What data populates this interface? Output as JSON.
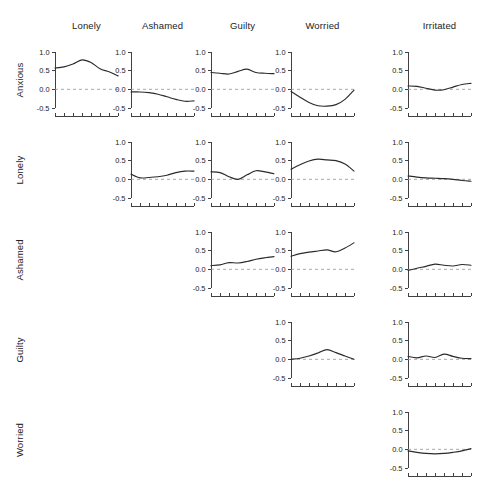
{
  "figure": {
    "width": 492,
    "height": 498,
    "background": "#ffffff",
    "line_color": "#2b2b2b",
    "zero_line_color": "#9a9a9a",
    "axis_color": "#2b2b2b"
  },
  "column_headers": [
    {
      "label": "Lonely"
    },
    {
      "label": "Ashamed"
    },
    {
      "label": "Guilty"
    },
    {
      "label": "Worried"
    },
    {
      "label": "Irritated"
    }
  ],
  "row_labels": [
    {
      "label": "Anxious"
    },
    {
      "label": "Lonely"
    },
    {
      "label": "Ashamed"
    },
    {
      "label": "Guilty"
    },
    {
      "label": "Worried"
    }
  ],
  "axis": {
    "y_ticks": [
      "1.0",
      "0.5",
      "0.0",
      "-0.5"
    ],
    "y_tick_values": [
      1.0,
      0.5,
      0.0,
      -0.5
    ],
    "ylim": [
      -0.5,
      1.0
    ],
    "x_tick_count": 8,
    "zero_reference": 0.0,
    "grid": false
  },
  "chart_data": {
    "type": "line",
    "title": "",
    "subtitle": "",
    "xlabel": "",
    "ylabel": "",
    "ylim": [
      -0.5,
      1.0
    ],
    "xlim": [
      0,
      1
    ],
    "grid": false,
    "legend": "none",
    "layout": "upper-triangular matrix of small-multiple line panels",
    "rows": [
      "Anxious",
      "Lonely",
      "Ashamed",
      "Guilty",
      "Worried"
    ],
    "columns": [
      "Lonely",
      "Ashamed",
      "Guilty",
      "Worried",
      "Irritated"
    ],
    "x": [
      0,
      0.1428,
      0.2857,
      0.4285,
      0.5714,
      0.7142,
      0.8571,
      1
    ],
    "panels": [
      {
        "row": "Anxious",
        "column": "Lonely",
        "row_index": 0,
        "col_index": 0,
        "values": [
          0.57,
          0.6,
          0.68,
          0.79,
          0.72,
          0.55,
          0.47,
          0.36
        ]
      },
      {
        "row": "Anxious",
        "column": "Ashamed",
        "row_index": 0,
        "col_index": 1,
        "values": [
          -0.07,
          -0.07,
          -0.09,
          -0.13,
          -0.2,
          -0.27,
          -0.32,
          -0.31
        ]
      },
      {
        "row": "Anxious",
        "column": "Guilty",
        "row_index": 0,
        "col_index": 2,
        "values": [
          0.45,
          0.43,
          0.41,
          0.48,
          0.54,
          0.45,
          0.43,
          0.42
        ]
      },
      {
        "row": "Anxious",
        "column": "Worried",
        "row_index": 0,
        "col_index": 3,
        "values": [
          -0.06,
          -0.21,
          -0.35,
          -0.44,
          -0.45,
          -0.41,
          -0.27,
          -0.02
        ]
      },
      {
        "row": "Anxious",
        "column": "Irritated",
        "row_index": 0,
        "col_index": 4,
        "values": [
          0.09,
          0.08,
          0.03,
          -0.02,
          -0.01,
          0.06,
          0.13,
          0.16
        ]
      },
      {
        "row": "Lonely",
        "column": "Ashamed",
        "row_index": 1,
        "col_index": 1,
        "values": [
          0.14,
          0.04,
          0.05,
          0.07,
          0.11,
          0.18,
          0.22,
          0.22
        ]
      },
      {
        "row": "Lonely",
        "column": "Guilty",
        "row_index": 1,
        "col_index": 2,
        "values": [
          0.2,
          0.18,
          0.07,
          0.0,
          0.12,
          0.23,
          0.2,
          0.15
        ]
      },
      {
        "row": "Lonely",
        "column": "Worried",
        "row_index": 1,
        "col_index": 3,
        "values": [
          0.27,
          0.39,
          0.49,
          0.54,
          0.52,
          0.5,
          0.41,
          0.22
        ]
      },
      {
        "row": "Lonely",
        "column": "Irritated",
        "row_index": 1,
        "col_index": 4,
        "values": [
          0.09,
          0.06,
          0.04,
          0.03,
          0.02,
          0.0,
          -0.03,
          -0.05
        ]
      },
      {
        "row": "Ashamed",
        "column": "Guilty",
        "row_index": 2,
        "col_index": 2,
        "values": [
          0.1,
          0.12,
          0.18,
          0.17,
          0.21,
          0.27,
          0.31,
          0.34
        ]
      },
      {
        "row": "Ashamed",
        "column": "Worried",
        "row_index": 2,
        "col_index": 3,
        "values": [
          0.35,
          0.42,
          0.46,
          0.49,
          0.52,
          0.47,
          0.57,
          0.71
        ]
      },
      {
        "row": "Ashamed",
        "column": "Irritated",
        "row_index": 2,
        "col_index": 4,
        "values": [
          -0.03,
          0.03,
          0.08,
          0.14,
          0.11,
          0.09,
          0.13,
          0.11
        ]
      },
      {
        "row": "Guilty",
        "column": "Worried",
        "row_index": 3,
        "col_index": 3,
        "values": [
          0.0,
          0.03,
          0.09,
          0.17,
          0.26,
          0.18,
          0.09,
          0.0
        ]
      },
      {
        "row": "Guilty",
        "column": "Irritated",
        "row_index": 3,
        "col_index": 4,
        "values": [
          0.08,
          0.04,
          0.09,
          0.05,
          0.14,
          0.08,
          0.03,
          0.02
        ]
      },
      {
        "row": "Worried",
        "column": "Irritated",
        "row_index": 4,
        "col_index": 4,
        "values": [
          -0.04,
          -0.08,
          -0.11,
          -0.12,
          -0.11,
          -0.08,
          -0.04,
          0.02
        ]
      }
    ]
  }
}
